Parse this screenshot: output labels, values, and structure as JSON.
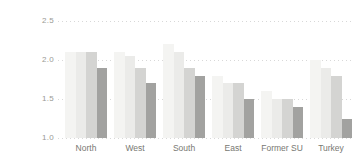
{
  "chart_data": {
    "type": "bar",
    "title": "",
    "xlabel": "",
    "ylabel": "",
    "categories": [
      "North",
      "West",
      "South",
      "East",
      "Former SU",
      "Turkey"
    ],
    "series": [
      {
        "name": "series-1-lightest",
        "color": "#f4f4f2",
        "values": [
          2.1,
          2.1,
          2.2,
          1.8,
          1.6,
          2.0
        ]
      },
      {
        "name": "series-2-light",
        "color": "#ebebe9",
        "values": [
          2.1,
          2.05,
          2.1,
          1.7,
          1.5,
          1.9
        ]
      },
      {
        "name": "series-3-medium",
        "color": "#d4d4d2",
        "values": [
          2.1,
          1.9,
          1.9,
          1.7,
          1.5,
          1.8
        ]
      },
      {
        "name": "series-4-dark",
        "color": "#a2a2a0",
        "values": [
          1.9,
          1.7,
          1.8,
          1.5,
          1.4,
          1.25
        ]
      }
    ],
    "ylim": [
      1.0,
      2.5
    ],
    "yticks": [
      1.0,
      1.5,
      2.0,
      2.5
    ],
    "ytick_labels": [
      "1.0",
      "1.5",
      "2.0",
      "2.5"
    ],
    "grid": "horizontal-dotted",
    "legend_position": "none"
  },
  "colors": {
    "background": "#ffffff",
    "gridline": "#d8d8d8",
    "ytick_text": "#9a9a94",
    "category_text": "#787872"
  }
}
